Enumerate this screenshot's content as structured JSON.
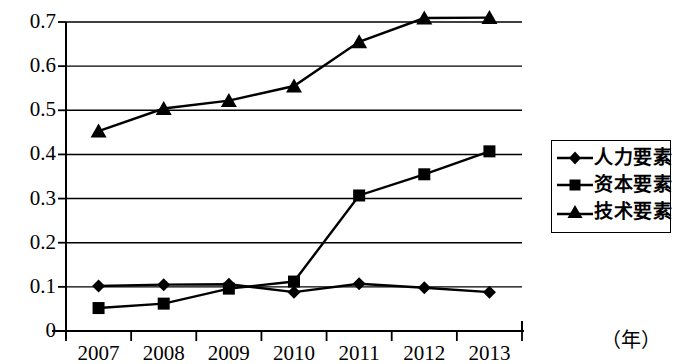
{
  "chart_data": {
    "type": "line",
    "title": "",
    "xlabel": "（年）",
    "ylabel": "",
    "categories": [
      "2007",
      "2008",
      "2009",
      "2010",
      "2011",
      "2012",
      "2013"
    ],
    "ylim": [
      0,
      0.7
    ],
    "yticks": [
      "0",
      "0.1",
      "0.2",
      "0.3",
      "0.4",
      "0.5",
      "0.6",
      "0.7"
    ],
    "ytick_values": [
      0,
      0.1,
      0.2,
      0.3,
      0.4,
      0.5,
      0.6,
      0.7
    ],
    "grid": true,
    "legend_position": "right",
    "series": [
      {
        "name": "人力要素",
        "marker": "diamond",
        "values": [
          0.102,
          0.105,
          0.106,
          0.088,
          0.107,
          0.098,
          0.088
        ]
      },
      {
        "name": "资本要素",
        "marker": "square",
        "values": [
          0.052,
          0.062,
          0.096,
          0.112,
          0.307,
          0.355,
          0.407
        ]
      },
      {
        "name": "技术要素",
        "marker": "triangle",
        "values": [
          0.453,
          0.504,
          0.522,
          0.555,
          0.655,
          0.709,
          0.71
        ]
      }
    ]
  },
  "axis": {
    "y_labels": [
      "0.7",
      "0.6",
      "0.5",
      "0.4",
      "0.3",
      "0.2",
      "0.1",
      "0"
    ],
    "x_labels": [
      "2007",
      "2008",
      "2009",
      "2010",
      "2011",
      "2012",
      "2013"
    ],
    "x_unit": "（年）"
  },
  "legend": {
    "items": [
      {
        "label": "人力要素",
        "marker": "diamond-marker"
      },
      {
        "label": "资本要素",
        "marker": "square-marker"
      },
      {
        "label": "技术要素",
        "marker": "triangle-marker"
      }
    ]
  },
  "colors": {
    "line": "#000000",
    "grid": "#000000",
    "background": "#ffffff"
  }
}
